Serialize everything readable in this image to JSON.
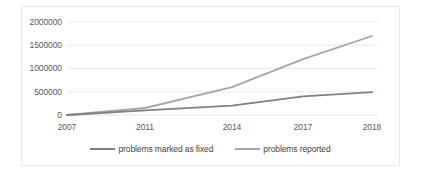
{
  "chart_data": {
    "type": "line",
    "title": "",
    "xlabel": "",
    "ylabel": "",
    "categories": [
      "2007",
      "2011",
      "2014",
      "2017",
      "2018"
    ],
    "ylim": [
      0,
      2000000
    ],
    "xlim_categories": [
      "2007",
      "2018"
    ],
    "y_ticks": [
      "0",
      "500000",
      "1000000",
      "1500000",
      "2000000"
    ],
    "y_tick_values": [
      0,
      500000,
      1000000,
      1500000,
      2000000
    ],
    "grid": "horizontal",
    "legend_position": "bottom-center",
    "series": [
      {
        "name": "problems marked as fixed",
        "color": "#808080",
        "values": [
          0,
          100000,
          200000,
          400000,
          490000
        ]
      },
      {
        "name": "problems reported",
        "color": "#a6a6a6",
        "values": [
          0,
          150000,
          600000,
          1200000,
          1700000
        ]
      }
    ]
  },
  "axis": {
    "y_labels": [
      "2000000",
      "1500000",
      "1000000",
      "500000",
      "0"
    ],
    "x_labels": [
      "2007",
      "2011",
      "2014",
      "2017",
      "2018"
    ]
  },
  "legend": {
    "items": [
      {
        "label": "problems marked as fixed",
        "color": "#808080"
      },
      {
        "label": "problems reported",
        "color": "#a6a6a6"
      }
    ]
  },
  "colors": {
    "frame_border": "#e8e8e8",
    "gridline": "#ececed",
    "axis_text": "#5a5a5a",
    "legend_text": "#3f3f3f",
    "series_fixed": "#808080",
    "series_reported": "#a6a6a6",
    "background": "#ffffff"
  }
}
